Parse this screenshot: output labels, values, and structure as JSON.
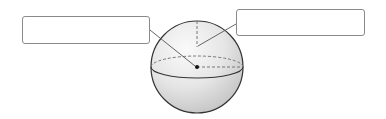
{
  "diagram": {
    "labels": [
      {
        "id": "left",
        "text": "",
        "points_to": "center"
      },
      {
        "id": "right",
        "text": "",
        "points_to": "radius"
      }
    ],
    "colors": {
      "outline": "#333333",
      "dashed": "#777777",
      "box_border": "#8a8a8a",
      "sphere_light": "#f4f4f4",
      "sphere_shadow": "#c8c8c8"
    }
  }
}
